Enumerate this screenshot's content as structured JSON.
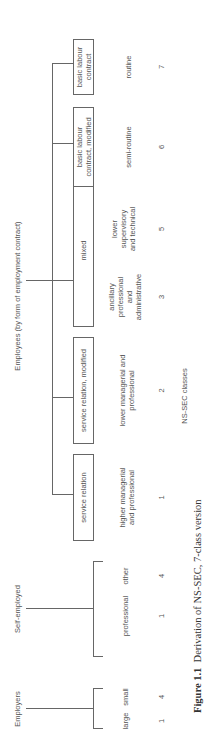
{
  "groups": {
    "employers": "Employers",
    "self_employed": "Self-employed",
    "employees": "Employees (by form of employment contract)"
  },
  "employers": [
    {
      "label": "large",
      "class": "1"
    },
    {
      "label": "small",
      "class": "4"
    }
  ],
  "self_employed": [
    {
      "label": "professional",
      "class": "1"
    },
    {
      "label": "other",
      "class": "4"
    }
  ],
  "employees": [
    {
      "box": "service relation",
      "label": "higher managerial\nand professional",
      "class": "1"
    },
    {
      "box": "service relation, modified",
      "label": "lower managerial and\nprofessional",
      "class": "2"
    },
    {
      "box": "mixed",
      "label": "ancillary\nprofessional\nand\nadministrative",
      "class": "3"
    },
    {
      "box": "",
      "label": "lower\nsupervisory\nand technical",
      "class": "5"
    },
    {
      "box": "basic labour\ncontract, modified",
      "label": "semi-routine",
      "class": "6"
    },
    {
      "box": "basic labour\ncontract",
      "label": "routine",
      "class": "7"
    }
  ],
  "axis_label": "NS-SEC classes",
  "caption": {
    "figure": "Figure 1.1",
    "text": "Derivation of NS-SEC, 7-class version"
  }
}
